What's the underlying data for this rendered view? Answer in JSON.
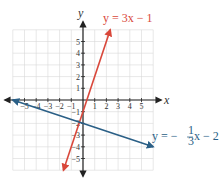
{
  "chart_data": {
    "type": "line",
    "title": "",
    "xlabel": "x",
    "ylabel": "y",
    "xlim": [
      -6,
      6
    ],
    "ylim": [
      -6,
      6
    ],
    "grid": true,
    "x_ticks": [
      "-5",
      "-4",
      "-3",
      "-2",
      "-1",
      "1",
      "2",
      "3",
      "4",
      "5"
    ],
    "y_ticks": [
      "5",
      "4",
      "3",
      "2",
      "1",
      "-1",
      "-2",
      "-3",
      "-4",
      "-5"
    ],
    "series": [
      {
        "name": "y = 3x - 1",
        "slope": 3,
        "intercept": -1,
        "color": "#d9473a",
        "x": [
          -1.67,
          2.33
        ],
        "y": [
          -6,
          6
        ],
        "label": "y = 3x − 1"
      },
      {
        "name": "y = -1/3 x - 2",
        "slope": -0.3333,
        "intercept": -2,
        "color": "#2a5f86",
        "x": [
          -6,
          6
        ],
        "y": [
          0,
          -4
        ],
        "label_prefix": "y = −",
        "label_frac_num": "1",
        "label_frac_den": "3",
        "label_suffix": "x − 2"
      }
    ]
  }
}
